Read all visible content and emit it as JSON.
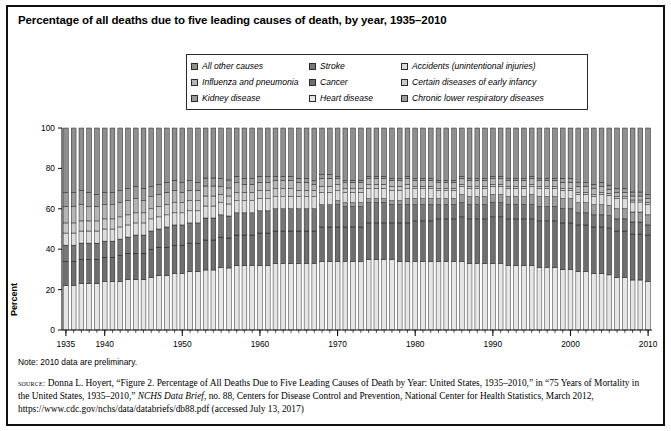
{
  "title": "Percentage of all deaths due to five leading causes of death, by year, 1935–2010",
  "legend": {
    "items": [
      {
        "label": "All other causes",
        "color": "#8f8f8f",
        "col": 1,
        "row": 1
      },
      {
        "label": "Influenza and pneumonia",
        "color": "#b5b5b5",
        "col": 1,
        "row": 2
      },
      {
        "label": "Kidney disease",
        "color": "#9a9a9a",
        "col": 1,
        "row": 3
      },
      {
        "label": "Stroke",
        "color": "#777777",
        "col": 2,
        "row": 1
      },
      {
        "label": "Cancer",
        "color": "#6e6e6e",
        "col": 2,
        "row": 2
      },
      {
        "label": "Heart disease",
        "color": "#e6e6e6",
        "col": 2,
        "row": 3
      },
      {
        "label": "Accidents (unintentional injuries)",
        "color": "#dcdcdc",
        "col": 3,
        "row": 1
      },
      {
        "label": "Certain diseases of early infancy",
        "color": "#c9c9c9",
        "col": 3,
        "row": 2
      },
      {
        "label": "Chronic lower respiratory diseases",
        "color": "#9c9c9c",
        "col": 3,
        "row": 3
      }
    ]
  },
  "axis": {
    "ylabel": "Percent",
    "yticks": [
      0,
      20,
      40,
      60,
      80,
      100
    ],
    "xticks": [
      1935,
      1940,
      1950,
      1960,
      1970,
      1980,
      1990,
      2000,
      2010
    ]
  },
  "note": "Note: 2010 data are preliminary.",
  "source": {
    "label": "source:",
    "line1": " Donna L. Hoyert, “Figure 2. Percentage of All Deaths Due to Five Leading Causes of Death by Year: United States, 1935–2010,” in “75",
    "line2_a": "Years of Mortality in the United States, 1935–2010,” ",
    "line2_ital": "NCHS Data Brief",
    "line2_b": ", no. 88, Centers for Disease Control and Prevention, National",
    "line3": "Center for Health Statistics, March 2012, https://www.cdc.gov/nchs/data/databriefs/db88.pdf (accessed July 13, 2017)"
  },
  "chart_data": {
    "type": "bar",
    "subtype": "stacked-100-percent",
    "title": "Percentage of all deaths due to five leading causes of death, by year, 1935–2010",
    "xlabel": "",
    "ylabel": "Percent",
    "ylim": [
      0,
      100
    ],
    "grid": false,
    "legend_position": "top",
    "xticks": [
      1935,
      1940,
      1950,
      1960,
      1970,
      1980,
      1990,
      2000,
      2010
    ],
    "yticks": [
      0,
      20,
      40,
      60,
      80,
      100
    ],
    "x": [
      1935,
      1936,
      1937,
      1938,
      1939,
      1940,
      1941,
      1942,
      1943,
      1944,
      1945,
      1946,
      1947,
      1948,
      1949,
      1950,
      1951,
      1952,
      1953,
      1954,
      1955,
      1956,
      1957,
      1958,
      1959,
      1960,
      1961,
      1962,
      1963,
      1964,
      1965,
      1966,
      1967,
      1968,
      1969,
      1970,
      1971,
      1972,
      1973,
      1974,
      1975,
      1976,
      1977,
      1978,
      1979,
      1980,
      1981,
      1982,
      1983,
      1984,
      1985,
      1986,
      1987,
      1988,
      1989,
      1990,
      1991,
      1992,
      1993,
      1994,
      1995,
      1996,
      1997,
      1998,
      1999,
      2000,
      2001,
      2002,
      2003,
      2004,
      2005,
      2006,
      2007,
      2008,
      2009,
      2010
    ],
    "stack_order_bottom_to_top": [
      "Heart disease",
      "Cancer",
      "Stroke",
      "Chronic lower respiratory diseases",
      "Accidents (unintentional injuries)",
      "Certain diseases of early infancy",
      "Influenza and pneumonia",
      "Kidney disease",
      "All other causes"
    ],
    "series": [
      {
        "name": "Heart disease",
        "color": "#e6e6e6",
        "values": [
          22,
          22,
          23,
          23,
          23,
          24,
          24,
          24,
          25,
          25,
          25,
          26,
          27,
          27,
          28,
          28,
          29,
          29,
          30,
          30,
          31,
          31,
          32,
          32,
          32,
          32,
          32,
          33,
          33,
          33,
          33,
          33,
          33,
          34,
          34,
          34,
          34,
          34,
          34,
          35,
          35,
          35,
          35,
          34,
          34,
          34,
          34,
          34,
          34,
          34,
          34,
          34,
          33,
          33,
          33,
          33,
          33,
          32,
          32,
          32,
          32,
          31,
          31,
          31,
          30,
          30,
          29,
          29,
          28,
          28,
          27,
          26,
          26,
          25,
          25,
          24
        ]
      },
      {
        "name": "Cancer",
        "color": "#6e6e6e",
        "values": [
          12,
          12,
          12,
          12,
          12,
          12,
          12,
          13,
          13,
          13,
          13,
          14,
          14,
          14,
          14,
          14,
          14,
          14,
          15,
          15,
          15,
          15,
          15,
          15,
          15,
          16,
          16,
          16,
          16,
          16,
          16,
          16,
          16,
          17,
          17,
          17,
          17,
          17,
          17,
          18,
          18,
          18,
          18,
          19,
          19,
          20,
          20,
          20,
          21,
          21,
          21,
          22,
          22,
          22,
          22,
          23,
          23,
          23,
          23,
          23,
          23,
          23,
          23,
          23,
          23,
          23,
          23,
          23,
          23,
          23,
          23,
          23,
          23,
          23,
          23,
          23
        ]
      },
      {
        "name": "Stroke",
        "color": "#777777",
        "values": [
          8,
          8,
          8,
          8,
          8,
          8,
          8,
          8,
          8,
          9,
          9,
          9,
          9,
          10,
          10,
          10,
          10,
          10,
          11,
          11,
          11,
          11,
          11,
          11,
          11,
          11,
          11,
          11,
          11,
          11,
          11,
          11,
          11,
          11,
          11,
          11,
          10,
          10,
          10,
          10,
          10,
          10,
          9,
          9,
          9,
          8,
          8,
          8,
          7,
          7,
          7,
          7,
          7,
          7,
          7,
          7,
          7,
          7,
          7,
          7,
          7,
          7,
          7,
          7,
          7,
          7,
          6,
          6,
          6,
          6,
          6,
          6,
          6,
          6,
          6,
          5
        ]
      },
      {
        "name": "Chronic lower respiratory diseases",
        "color": "#9c9c9c",
        "values": [
          0,
          0,
          0,
          0,
          0,
          0,
          0,
          0,
          0,
          0,
          0,
          0,
          0,
          0,
          0,
          0,
          0,
          0,
          0,
          0,
          0,
          0,
          0,
          0,
          0,
          0,
          0,
          0,
          0,
          0,
          0,
          0,
          0,
          0,
          0,
          2,
          2,
          2,
          2,
          2,
          2,
          2,
          2,
          2,
          3,
          3,
          3,
          3,
          3,
          3,
          3,
          4,
          4,
          4,
          4,
          4,
          4,
          4,
          4,
          4,
          5,
          5,
          5,
          5,
          5,
          5,
          5,
          5,
          5,
          5,
          5,
          5,
          5,
          5,
          5,
          5
        ]
      },
      {
        "name": "Accidents (unintentional injuries)",
        "color": "#dcdcdc",
        "values": [
          6,
          6,
          6,
          6,
          6,
          6,
          6,
          6,
          6,
          6,
          6,
          6,
          6,
          6,
          6,
          6,
          6,
          6,
          6,
          6,
          6,
          6,
          6,
          6,
          6,
          6,
          6,
          6,
          6,
          6,
          6,
          6,
          6,
          6,
          6,
          5,
          5,
          5,
          5,
          5,
          5,
          5,
          5,
          5,
          5,
          5,
          5,
          5,
          4,
          4,
          4,
          4,
          4,
          4,
          4,
          4,
          4,
          4,
          4,
          4,
          4,
          4,
          4,
          4,
          4,
          4,
          4,
          4,
          4,
          5,
          5,
          5,
          5,
          5,
          5,
          5
        ]
      },
      {
        "name": "Certain diseases of early infancy",
        "color": "#c9c9c9",
        "values": [
          5,
          5,
          5,
          5,
          5,
          5,
          5,
          5,
          5,
          5,
          5,
          5,
          5,
          5,
          5,
          5,
          5,
          5,
          5,
          5,
          4,
          4,
          4,
          4,
          4,
          4,
          4,
          4,
          4,
          4,
          3,
          3,
          3,
          3,
          3,
          3,
          2,
          2,
          2,
          2,
          2,
          2,
          2,
          2,
          2,
          1,
          1,
          1,
          1,
          1,
          1,
          1,
          1,
          1,
          1,
          1,
          1,
          1,
          1,
          1,
          1,
          1,
          1,
          1,
          1,
          1,
          1,
          1,
          1,
          1,
          1,
          1,
          1,
          1,
          1,
          1
        ]
      },
      {
        "name": "Influenza and pneumonia",
        "color": "#b5b5b5",
        "values": [
          8,
          8,
          8,
          7,
          7,
          7,
          7,
          7,
          7,
          7,
          6,
          6,
          6,
          6,
          6,
          5,
          5,
          5,
          5,
          5,
          4,
          4,
          5,
          4,
          4,
          4,
          4,
          4,
          4,
          4,
          4,
          4,
          3,
          4,
          4,
          3,
          3,
          3,
          3,
          3,
          3,
          3,
          3,
          3,
          3,
          3,
          3,
          3,
          3,
          3,
          3,
          3,
          3,
          3,
          3,
          3,
          3,
          3,
          3,
          3,
          3,
          3,
          3,
          3,
          3,
          3,
          3,
          3,
          3,
          3,
          2,
          2,
          2,
          2,
          2,
          2
        ]
      },
      {
        "name": "Kidney disease",
        "color": "#9a9a9a",
        "values": [
          7,
          7,
          7,
          7,
          6,
          6,
          6,
          6,
          6,
          6,
          6,
          5,
          5,
          5,
          5,
          5,
          5,
          4,
          4,
          4,
          4,
          4,
          3,
          3,
          3,
          3,
          3,
          2,
          2,
          2,
          2,
          2,
          2,
          2,
          2,
          1,
          1,
          1,
          1,
          1,
          1,
          1,
          1,
          1,
          1,
          1,
          1,
          1,
          1,
          1,
          1,
          1,
          1,
          1,
          1,
          1,
          1,
          1,
          1,
          1,
          1,
          1,
          1,
          1,
          2,
          2,
          2,
          2,
          2,
          2,
          2,
          2,
          2,
          2,
          2,
          2
        ]
      },
      {
        "name": "All other causes",
        "color": "#8f8f8f",
        "values": [
          32,
          32,
          31,
          32,
          33,
          32,
          32,
          31,
          30,
          29,
          30,
          29,
          28,
          27,
          26,
          27,
          26,
          27,
          25,
          25,
          25,
          26,
          24,
          25,
          25,
          24,
          24,
          24,
          24,
          24,
          25,
          25,
          26,
          23,
          23,
          24,
          26,
          26,
          26,
          24,
          24,
          24,
          25,
          25,
          24,
          25,
          25,
          25,
          26,
          26,
          26,
          24,
          25,
          25,
          25,
          24,
          24,
          25,
          25,
          25,
          24,
          25,
          25,
          25,
          25,
          25,
          27,
          27,
          28,
          27,
          28,
          30,
          30,
          32,
          32,
          33
        ]
      }
    ]
  }
}
